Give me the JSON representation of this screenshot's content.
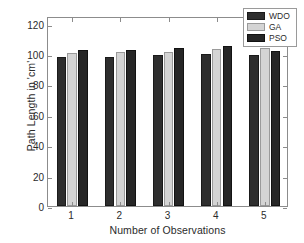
{
  "chart_data": {
    "type": "bar",
    "title": "",
    "xlabel": "Number of Observations",
    "ylabel": "Path Length in 'cm'",
    "categories": [
      "1",
      "2",
      "3",
      "4",
      "5"
    ],
    "series": [
      {
        "name": "WDO",
        "color": "#2e2e2e",
        "values": [
          98.2,
          98.1,
          99.2,
          100.1,
          99.1
        ]
      },
      {
        "name": "GA",
        "color": "#d4d4d4",
        "values": [
          100.9,
          101.3,
          101.5,
          103.2,
          104.0
        ]
      },
      {
        "name": "PSO",
        "color": "#262626",
        "values": [
          102.6,
          102.9,
          103.8,
          105.1,
          101.9
        ]
      }
    ],
    "ylim": [
      0,
      125
    ],
    "yticks": [
      0,
      20,
      40,
      60,
      80,
      100,
      120
    ],
    "ytick_labels": [
      "0",
      "20",
      "40",
      "60",
      "80",
      "100",
      "120"
    ],
    "xtick_labels": [
      "1",
      "2",
      "3",
      "4",
      "5"
    ],
    "grid": false,
    "legend_position": "top-right",
    "legend_entries": [
      "WDO",
      "GA",
      "PSO"
    ],
    "axis_color": "#8c8c8c",
    "background": "#ffffff"
  }
}
